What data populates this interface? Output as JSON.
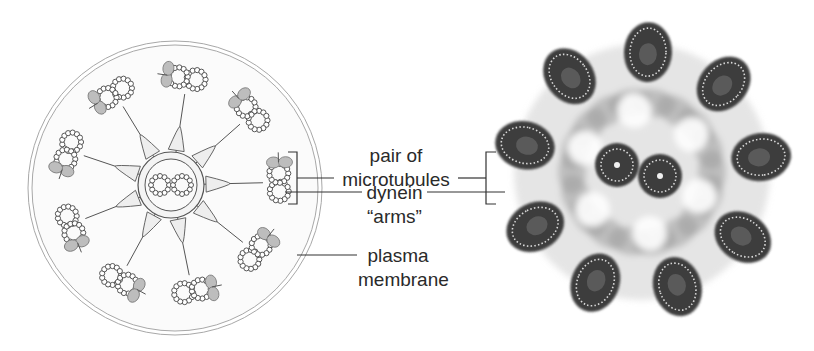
{
  "figure": {
    "left_panel": {
      "name": "cilium cross-section diagram",
      "doublet_count": 9,
      "central_pair_count": 2,
      "spoke_count": 9
    },
    "right_panel": {
      "name": "electron micrograph of cilium cross-section"
    }
  },
  "labels": {
    "pair_of_microtubules": {
      "line1": "pair of",
      "line2": "microtubules"
    },
    "dynein_arms": {
      "line1": "dynein",
      "line2": "“arms”"
    },
    "plasma_membrane": {
      "line1": "plasma",
      "line2": "membrane"
    }
  },
  "colors": {
    "line": "#3a3a3a",
    "membrane": "#9a9a9a",
    "dynein_fill": "#bdbdbd",
    "micrograph_dark": "#3c3c3c",
    "micrograph_haze": "#b8b8b8"
  }
}
